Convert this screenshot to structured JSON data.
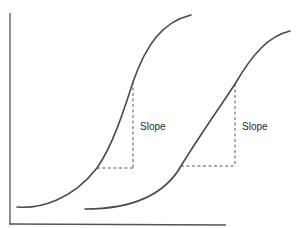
{
  "diagram": {
    "type": "two-sigmoid-curves-with-slope-triangles",
    "axes": {
      "x_label": "",
      "y_label": "",
      "color": "#555555"
    },
    "curves": [
      {
        "id": "curve-1",
        "description": "left S-shaped (sigmoid) curve, steeper",
        "color": "#4a4a4a"
      },
      {
        "id": "curve-2",
        "description": "right S-shaped (sigmoid) curve, shifted right, less steep",
        "color": "#4a4a4a"
      }
    ],
    "slope_annotations": [
      {
        "label": "Slope",
        "style": "dashed right-angle triangle",
        "curve": "curve-1"
      },
      {
        "label": "Slope",
        "style": "dashed right-angle triangle",
        "curve": "curve-2"
      }
    ],
    "dash_color": "#555555"
  }
}
